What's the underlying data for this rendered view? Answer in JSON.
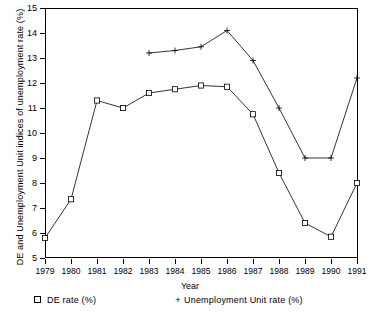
{
  "chart_data": {
    "type": "line",
    "title": "",
    "xlabel": "Year",
    "ylabel": "DE and Unemployment Unit indices of unemployment rate (%)",
    "x": [
      1979,
      1980,
      1981,
      1982,
      1983,
      1984,
      1985,
      1986,
      1987,
      1988,
      1989,
      1990,
      1991
    ],
    "xlim": [
      1979,
      1991
    ],
    "ylim": [
      5,
      15
    ],
    "yticks": [
      5,
      6,
      7,
      8,
      9,
      10,
      11,
      12,
      13,
      14,
      15
    ],
    "xticks": [
      "1979",
      "1980",
      "1981",
      "1982",
      "1983",
      "1984",
      "1985",
      "1986",
      "1987",
      "1988",
      "1989",
      "1990",
      "1991"
    ],
    "grid": false,
    "legend_position": "below-axes",
    "series": [
      {
        "name": "DE rate (%)",
        "marker": "square",
        "x": [
          1979,
          1980,
          1981,
          1982,
          1983,
          1984,
          1985,
          1986,
          1987,
          1988,
          1989,
          1990,
          1991
        ],
        "values": [
          5.8,
          7.35,
          11.3,
          11.0,
          11.6,
          11.75,
          11.9,
          11.85,
          10.75,
          8.4,
          6.4,
          5.85,
          8.0
        ]
      },
      {
        "name": "Unemployment Unit rate (%)",
        "marker": "plus",
        "x": [
          1983,
          1984,
          1985,
          1986,
          1987,
          1988,
          1989,
          1990,
          1991
        ],
        "values": [
          13.2,
          13.3,
          13.45,
          14.1,
          12.9,
          11.0,
          9.0,
          9.0,
          12.2
        ]
      }
    ]
  },
  "axis": {
    "y_title": "DE and Unemployment Unit indices of unemployment rate (%)",
    "x_title": "Year",
    "y_tick_labels": [
      "15",
      "14",
      "13",
      "12",
      "11",
      "10",
      "9",
      "8",
      "7",
      "6",
      "5"
    ],
    "x_tick_labels": [
      "1979",
      "1980",
      "1981",
      "1982",
      "1983",
      "1984",
      "1985",
      "1986",
      "1987",
      "1988",
      "1989",
      "1990",
      "1991"
    ]
  },
  "legend": {
    "de_marker": "square-marker",
    "de_label": "DE rate (%)",
    "uu_marker": "+",
    "uu_label": "Unemployment Unit rate (%)"
  }
}
